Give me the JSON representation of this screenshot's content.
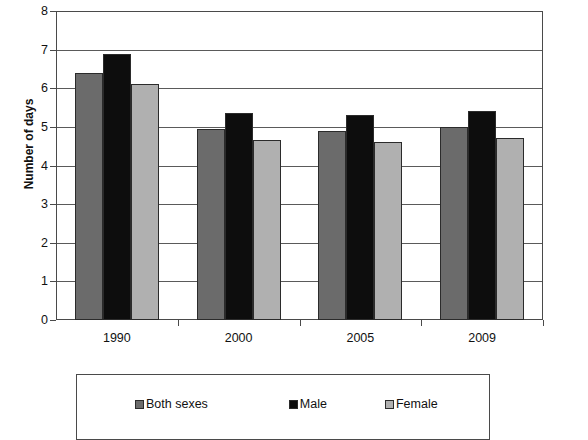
{
  "chart_data": {
    "type": "bar",
    "title": "",
    "xlabel": "",
    "ylabel": "Number of days",
    "categories": [
      "1990",
      "2000",
      "2005",
      "2009"
    ],
    "series": [
      {
        "name": "Both sexes",
        "color": "#6b6b6b",
        "values": [
          6.4,
          4.95,
          4.9,
          5.0
        ]
      },
      {
        "name": "Male",
        "color": "#0d0d0d",
        "values": [
          6.9,
          5.35,
          5.3,
          5.4
        ]
      },
      {
        "name": "Female",
        "color": "#b0b0b0",
        "values": [
          6.1,
          4.65,
          4.6,
          4.7
        ]
      }
    ],
    "ylim": [
      0,
      8
    ],
    "ytick_labels": [
      "8",
      "7",
      "6",
      "5",
      "4",
      "3",
      "2",
      "1",
      "0"
    ],
    "ytick_values": [
      8,
      7,
      6,
      5,
      4,
      3,
      2,
      1,
      0
    ],
    "grid": true,
    "grid_axis": "y",
    "legend_position": "bottom",
    "legend_entries": [
      "Both sexes",
      "Male",
      "Female"
    ]
  },
  "title_strip": {
    "text": ""
  }
}
